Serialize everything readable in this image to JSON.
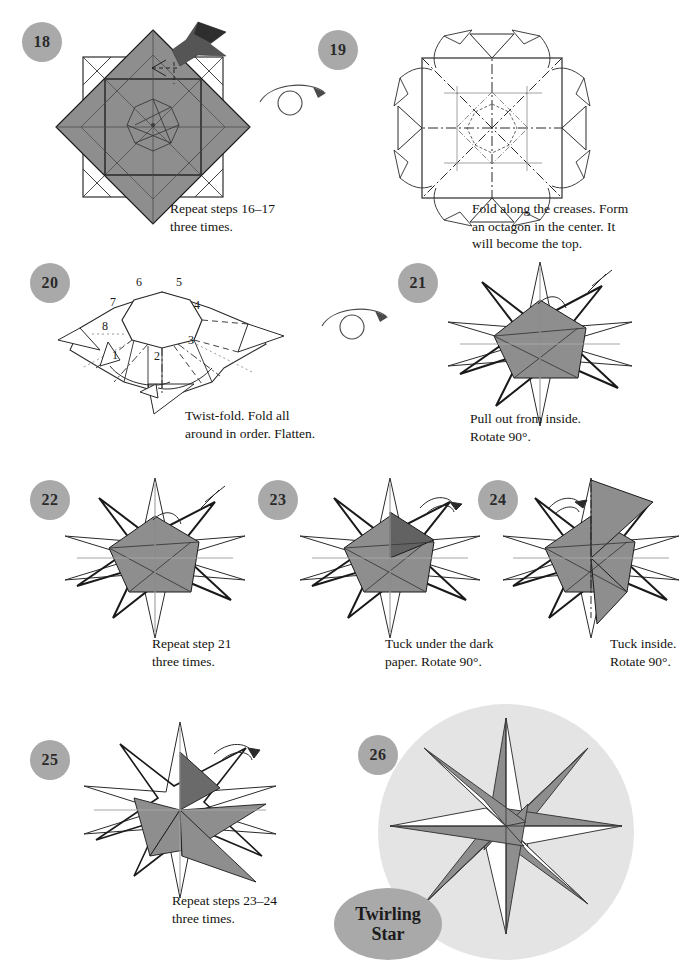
{
  "document": {
    "type": "origami-instructions",
    "model_name_line1": "Twirling",
    "model_name_line2": "Star",
    "colors": {
      "badge_gray": "#a9a9a9",
      "paper_gray": "#8e8e8e",
      "paper_dark_gray": "#6a6a6a",
      "halo_gray": "#e3e3e3",
      "line_black": "#1a1a1a",
      "crease_gray": "#9a9a9a",
      "text": "#14130f",
      "page_background": "#ffffff"
    }
  },
  "steps": [
    {
      "number": "18",
      "caption": "Repeat steps 16–17\nthree times.",
      "icons": [
        "push-arrow-icon",
        "valley-fold-arrow-icon"
      ],
      "diagram": "square-with-rotated-gray-diamond-and-creases"
    },
    {
      "number": "19",
      "caption": "Fold along the creases. Form\nan octagon in the center. It\nwill become the top.",
      "icons": [
        "turn-over-icon",
        "fold-arrow-icon"
      ],
      "diagram": "crease-pattern-square-with-octagon-center"
    },
    {
      "number": "20",
      "caption": "Twist-fold. Fold all\naround in order. Flatten.",
      "flap_labels": [
        "1",
        "2",
        "3",
        "4",
        "5",
        "6",
        "7",
        "8"
      ],
      "icons": [
        "twist-fold-arrow-icon"
      ],
      "diagram": "octagon-center-with-numbered-flaps"
    },
    {
      "number": "21",
      "caption": "Pull out from inside.\nRotate 90°.",
      "icons": [
        "turn-over-icon",
        "pull-out-arrow-icon"
      ],
      "diagram": "eight-point-star-gray-center"
    },
    {
      "number": "22",
      "caption": "Repeat step 21\nthree times.",
      "icons": [
        "pull-out-arrow-icon"
      ],
      "diagram": "eight-point-star-gray-center"
    },
    {
      "number": "23",
      "caption": "Tuck under the dark\npaper. Rotate 90°.",
      "icons": [
        "tuck-arrow-icon"
      ],
      "diagram": "eight-point-star-with-dark-triangle"
    },
    {
      "number": "24",
      "caption": "Tuck inside.\nRotate 90°.",
      "icons": [
        "tuck-arrow-icon"
      ],
      "diagram": "eight-point-star-with-long-gray-point"
    },
    {
      "number": "25",
      "caption": "Repeat steps 23–24\nthree times.",
      "icons": [
        "tuck-arrow-icon"
      ],
      "diagram": "eight-point-star-pinwheel-partial"
    },
    {
      "number": "26",
      "caption": "",
      "icons": [],
      "diagram": "finished-twirling-star-pinwheel"
    }
  ]
}
